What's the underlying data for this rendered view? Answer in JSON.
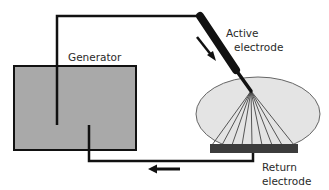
{
  "diagram": {
    "labels": {
      "generator": "Generator",
      "active_line1": "Active",
      "active_line2": "electrode",
      "return_line1": "Return",
      "return_line2": "electrode"
    },
    "colors": {
      "generator_fill": "#a9a9a9",
      "tissue_fill": "#e4e4e4",
      "return_plate": "#3c3c3c",
      "wire": "#111111",
      "rays": "#444444"
    },
    "components": [
      "generator",
      "active-electrode",
      "tissue",
      "return-electrode",
      "current-flow-arrows"
    ]
  }
}
